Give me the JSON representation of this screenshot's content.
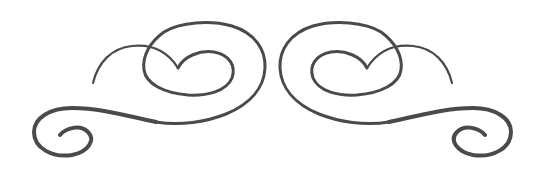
{
  "ornament": {
    "type": "decorative-swirl-divider",
    "description": "Symmetric calligraphic flourish with heart-shaped loops",
    "stroke_color": "#4a4a4a",
    "background_color": "#ffffff",
    "symmetry_axis_x": 272.5
  }
}
